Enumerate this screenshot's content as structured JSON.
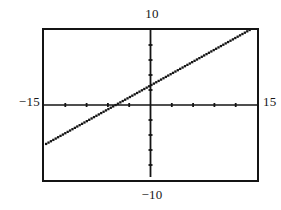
{
  "screen": {
    "kind": "graphing-calculator-plot",
    "background_color": "#ffffff",
    "frame_color": "#141414"
  },
  "labels": {
    "y_max": "10",
    "y_min": "−10",
    "x_min": "−15",
    "x_max": "15"
  },
  "chart_data": {
    "type": "line",
    "title": "",
    "subtitle": "",
    "xlabel": "",
    "ylabel": "",
    "xlim": [
      -15,
      15
    ],
    "ylim": [
      -10,
      10
    ],
    "grid": false,
    "legend": null,
    "axes": {
      "x_axis_y_value": 0,
      "y_axis_x_value": 0,
      "x_tick_step": 3,
      "y_tick_step": 2,
      "x_ticks": [
        -15,
        -12,
        -9,
        -6,
        -3,
        3,
        6,
        9,
        12,
        15
      ],
      "y_ticks": [
        -8,
        -6,
        -4,
        -2,
        2,
        4,
        6,
        8
      ],
      "tick_mark_size_px": 4,
      "axis_color": "#141414"
    },
    "series": [
      {
        "name": "y = 0.53x + 2.6",
        "style": "dotted-square-pixels",
        "color": "#141414",
        "slope": 0.53,
        "intercept": 2.6,
        "x_intercept": -4.9,
        "y_intercept": 2.6,
        "x_start": -14.7,
        "x_end": 14.3,
        "points": [
          {
            "x": -14.7,
            "y": -5.2
          },
          {
            "x": -12.0,
            "y": -3.8
          },
          {
            "x": -9.0,
            "y": -2.2
          },
          {
            "x": -6.0,
            "y": -0.6
          },
          {
            "x": -4.9,
            "y": 0.0
          },
          {
            "x": -3.0,
            "y": 1.0
          },
          {
            "x": 0.0,
            "y": 2.6
          },
          {
            "x": 3.0,
            "y": 4.2
          },
          {
            "x": 6.0,
            "y": 5.8
          },
          {
            "x": 9.0,
            "y": 7.4
          },
          {
            "x": 12.0,
            "y": 8.9
          },
          {
            "x": 14.3,
            "y": 10.2
          }
        ]
      }
    ],
    "annotations": [
      {
        "text": "10",
        "position": "above-plot-centered-on-y-axis"
      },
      {
        "text": "−10",
        "position": "below-plot-centered-on-y-axis"
      },
      {
        "text": "−15",
        "position": "left-of-plot-on-x-axis"
      },
      {
        "text": "15",
        "position": "right-of-plot-on-x-axis"
      }
    ]
  }
}
